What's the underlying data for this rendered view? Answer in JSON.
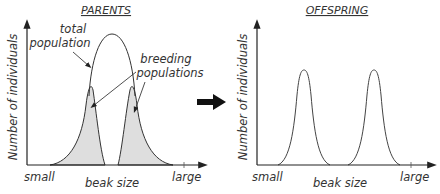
{
  "left_panel": {
    "title": "PARENTS",
    "y_label": "Number of individuals",
    "x_label": "beak size",
    "x_min_label": "small",
    "x_max_label": "large",
    "annotation_total_line1": "total",
    "annotation_total_line2": "population",
    "annotation_breeding_line1": "breeding",
    "annotation_breeding_line2": "populations"
  },
  "right_panel": {
    "title": "OFFSPRING",
    "y_label": "Number of individuals",
    "x_label": "beak size",
    "x_min_label": "small",
    "x_max_label": "large"
  },
  "arrow_icon": "right-arrow-icon",
  "colors": {
    "line": "#333333",
    "fill": "#dedede",
    "text": "#333333"
  }
}
